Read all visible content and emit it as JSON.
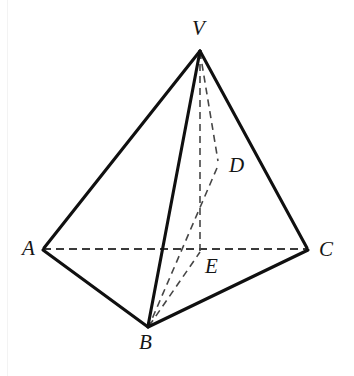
{
  "figure": {
    "type": "geometry-diagram",
    "background_color": "#ffffff",
    "stroke_color_solid": "#101010",
    "stroke_color_dashed": "#3a3a3a",
    "width": 354,
    "height": 376
  },
  "labels": {
    "V": "V",
    "A": "A",
    "B": "B",
    "C": "C",
    "D": "D",
    "E": "E"
  },
  "label_positions": {
    "V": {
      "x": 192,
      "y": 18
    },
    "A": {
      "x": 22,
      "y": 238
    },
    "B": {
      "x": 139,
      "y": 332
    },
    "C": {
      "x": 319,
      "y": 239
    },
    "D": {
      "x": 229,
      "y": 155
    },
    "E": {
      "x": 205,
      "y": 256
    }
  },
  "points": {
    "V": {
      "x": 200,
      "y": 50
    },
    "A": {
      "x": 43,
      "y": 249
    },
    "B": {
      "x": 148,
      "y": 327
    },
    "C": {
      "x": 308,
      "y": 249
    },
    "D": {
      "x": 218,
      "y": 163
    },
    "E": {
      "x": 200,
      "y": 249
    }
  },
  "edges": [
    {
      "name": "VA",
      "from": "V",
      "to": "A",
      "style": "solid"
    },
    {
      "name": "VB",
      "from": "V",
      "to": "B",
      "style": "solid"
    },
    {
      "name": "VC",
      "from": "V",
      "to": "C",
      "style": "solid"
    },
    {
      "name": "AB",
      "from": "A",
      "to": "B",
      "style": "solid"
    },
    {
      "name": "BC",
      "from": "B",
      "to": "C",
      "style": "solid"
    },
    {
      "name": "AC",
      "from": "A",
      "to": "C",
      "style": "dashed"
    },
    {
      "name": "VE",
      "from": "V",
      "to": "E",
      "style": "dashed"
    },
    {
      "name": "VD",
      "from": "V",
      "to": "D",
      "style": "dashed"
    },
    {
      "name": "DB",
      "from": "D",
      "to": "B",
      "style": "dashed"
    },
    {
      "name": "BE",
      "from": "B",
      "to": "E",
      "style": "dashed"
    }
  ]
}
